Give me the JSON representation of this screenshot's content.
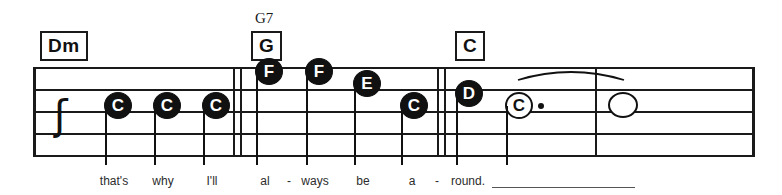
{
  "score": {
    "staff": {
      "left": 33,
      "right": 755,
      "top": 67,
      "bottom": 155,
      "line_count": 5
    },
    "rest": {
      "name": "quarter-rest",
      "glyph": " ʃ",
      "x": 46,
      "y": 95
    },
    "barlines": [
      {
        "x": 233,
        "type": "single"
      },
      {
        "x": 240,
        "type": "single"
      },
      {
        "x": 437,
        "type": "single"
      },
      {
        "x": 444,
        "type": "single"
      },
      {
        "x": 595,
        "type": "single"
      }
    ],
    "chords": [
      {
        "label": "Dm",
        "x": 40,
        "y": 31,
        "upper": ""
      },
      {
        "label": "G",
        "x": 251,
        "y": 31,
        "upper": "G7",
        "upper_x": 255,
        "upper_y": 10
      },
      {
        "label": "C",
        "x": 455,
        "y": 31,
        "upper": ""
      }
    ],
    "notes": [
      {
        "letter": "C",
        "x": 104,
        "y": 92,
        "style": "filled",
        "stem": "down",
        "dotted": false
      },
      {
        "letter": "C",
        "x": 153,
        "y": 92,
        "style": "filled",
        "stem": "down",
        "dotted": false
      },
      {
        "letter": "C",
        "x": 202,
        "y": 92,
        "style": "filled",
        "stem": "down",
        "dotted": false
      },
      {
        "letter": "F",
        "x": 255,
        "y": 58,
        "style": "filled",
        "stem": "down",
        "dotted": false
      },
      {
        "letter": "F",
        "x": 305,
        "y": 58,
        "style": "filled",
        "stem": "down",
        "dotted": false
      },
      {
        "letter": "E",
        "x": 353,
        "y": 70,
        "style": "filled",
        "stem": "down",
        "dotted": false
      },
      {
        "letter": "C",
        "x": 400,
        "y": 92,
        "style": "filled",
        "stem": "down",
        "dotted": false
      },
      {
        "letter": "D",
        "x": 455,
        "y": 80,
        "style": "filled",
        "stem": "down",
        "dotted": false
      },
      {
        "letter": "C",
        "x": 505,
        "y": 92,
        "style": "hollow",
        "stem": "down",
        "dotted": true
      },
      {
        "letter": "",
        "x": 608,
        "y": 92,
        "style": "empty",
        "stem": "none",
        "dotted": false
      }
    ],
    "tie": {
      "name": "tie-slur",
      "from_x": 518,
      "to_x": 624,
      "y": 80,
      "height": 16
    },
    "lyrics": [
      {
        "text": "that's",
        "x": 114
      },
      {
        "text": "why",
        "x": 163
      },
      {
        "text": "I'll",
        "x": 212
      },
      {
        "text": "al",
        "x": 265
      },
      {
        "text": "-",
        "x": 289
      },
      {
        "text": "ways",
        "x": 315
      },
      {
        "text": "be",
        "x": 363
      },
      {
        "text": "a",
        "x": 412
      },
      {
        "text": "-",
        "x": 437
      },
      {
        "text": "round.",
        "x": 468
      }
    ],
    "lyric_baseline_y": 174,
    "lyric_extender": {
      "x": 492,
      "y": 187,
      "width": 143
    }
  }
}
